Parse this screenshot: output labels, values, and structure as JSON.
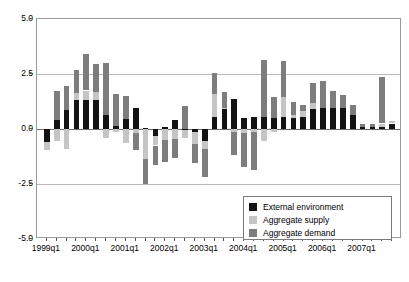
{
  "chart_data": {
    "type": "bar",
    "title": "",
    "subtitle": "",
    "xlabel": "",
    "ylabel": "",
    "stacked": true,
    "grid": true,
    "legend_position": "bottom-right",
    "ylim": [
      -5.0,
      5.0
    ],
    "yticks": [
      5.0,
      2.5,
      0.0,
      -2.5,
      -5.0
    ],
    "ytick_labels": [
      "5.0",
      "2.5",
      "0.0",
      "-2.5",
      "-5.0"
    ],
    "xtick_labels": [
      "1999q1",
      "2000q1",
      "2001q1",
      "2002q1",
      "2003q1",
      "2004q1",
      "2005q1",
      "2006q1",
      "2007q1"
    ],
    "xtick_indices": [
      0,
      4,
      8,
      12,
      16,
      20,
      24,
      28,
      32
    ],
    "categories": [
      "1999q1",
      "1999q2",
      "1999q3",
      "1999q4",
      "2000q1",
      "2000q2",
      "2000q3",
      "2000q4",
      "2001q1",
      "2001q2",
      "2001q3",
      "2001q4",
      "2002q1",
      "2002q2",
      "2002q3",
      "2002q4",
      "2003q1",
      "2003q2",
      "2003q3",
      "2003q4",
      "2004q1",
      "2004q2",
      "2004q3",
      "2004q4",
      "2005q1",
      "2005q2",
      "2005q3",
      "2005q4",
      "2006q1",
      "2006q2",
      "2006q3",
      "2006q4",
      "2007q1",
      "2007q2",
      "2007q3",
      "2007q4"
    ],
    "series": [
      {
        "name": "External environment",
        "color": "#131313",
        "values": [
          -0.6,
          0.4,
          0.85,
          1.3,
          1.3,
          1.3,
          0.65,
          0.15,
          0.45,
          0.95,
          0.05,
          -0.3,
          0.1,
          0.4,
          -0.05,
          -0.15,
          -0.55,
          0.55,
          0.9,
          1.35,
          0.5,
          0.55,
          0.55,
          0.5,
          0.55,
          0.5,
          0.55,
          0.9,
          0.95,
          0.95,
          0.95,
          0.65,
          0.1,
          0.1,
          0.1,
          0.25
        ]
      },
      {
        "name": "Aggregate supply",
        "color": "#c5c5c5",
        "values": [
          -0.35,
          -0.55,
          -0.9,
          0.35,
          0.45,
          0.4,
          -0.4,
          -0.15,
          -0.65,
          -0.2,
          -1.35,
          -0.45,
          -0.5,
          -0.45,
          -0.35,
          -0.55,
          -0.35,
          1.05,
          0.05,
          -0.15,
          -0.2,
          -0.15,
          -0.55,
          -0.15,
          0.9,
          0.15,
          0.25,
          0.3,
          0.0,
          0.0,
          0.0,
          0.0,
          0.0,
          0.0,
          0.15,
          0.1
        ]
      },
      {
        "name": "Aggregate demand",
        "color": "#7d7d7d",
        "values": [
          0.0,
          1.35,
          1.1,
          1.05,
          1.65,
          1.25,
          2.35,
          1.45,
          1.05,
          -0.75,
          -1.15,
          -0.9,
          -1.0,
          -0.85,
          1.05,
          -0.85,
          -1.3,
          0.95,
          0.75,
          -1.05,
          -1.55,
          -1.7,
          2.6,
          0.95,
          1.65,
          0.6,
          0.3,
          0.9,
          1.25,
          0.8,
          0.6,
          0.45,
          0.15,
          0.15,
          2.1,
          0.0
        ]
      }
    ]
  },
  "legend": {
    "items": [
      {
        "label": "External environment",
        "color": "#131313"
      },
      {
        "label": "Aggregate supply",
        "color": "#c5c5c5"
      },
      {
        "label": "Aggregate demand",
        "color": "#7d7d7d"
      }
    ]
  }
}
